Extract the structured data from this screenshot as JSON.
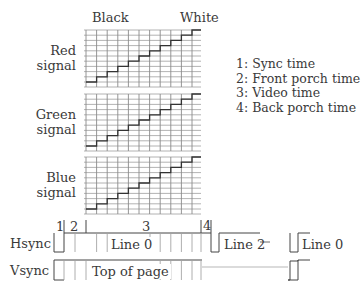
{
  "header": {
    "black_label": "Black",
    "white_label": "White"
  },
  "signals": [
    {
      "line1": "Red",
      "line2": "signal"
    },
    {
      "line1": "Green",
      "line2": "signal"
    },
    {
      "line1": "Blue",
      "line2": "signal"
    }
  ],
  "legend": [
    "1: Sync time",
    "2: Front porch time",
    "3: Video time",
    "4: Back porch time"
  ],
  "timing": {
    "markers": [
      "1",
      "2",
      "3",
      "4"
    ],
    "hsync": {
      "label": "Hsync",
      "line0": "Line 0",
      "line2": "Line 2",
      "line0b": "Line 0"
    },
    "vsync": {
      "label": "Vsync",
      "top": "Top of page"
    }
  },
  "colors": {
    "grid": "#9a9a9a",
    "trace": "#333333",
    "text": "#3a3a3a"
  }
}
